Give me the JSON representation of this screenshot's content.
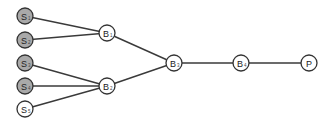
{
  "diagram": {
    "type": "tree",
    "colors": {
      "filled": "#a9a9a9",
      "empty": "#ffffff",
      "stroke": "#333333",
      "edge": "#3a3a3a"
    },
    "nodes": [
      {
        "id": "S1",
        "label": "S",
        "sub": "1",
        "x": 25,
        "y": 16,
        "filled": true
      },
      {
        "id": "S2",
        "label": "S",
        "sub": "2",
        "x": 25,
        "y": 40,
        "filled": true
      },
      {
        "id": "S3",
        "label": "S",
        "sub": "3",
        "x": 25,
        "y": 63,
        "filled": true
      },
      {
        "id": "S4",
        "label": "S",
        "sub": "4",
        "x": 25,
        "y": 86,
        "filled": true
      },
      {
        "id": "S5",
        "label": "S",
        "sub": "5",
        "x": 25,
        "y": 109,
        "filled": false
      },
      {
        "id": "B1",
        "label": "B",
        "sub": "1",
        "x": 107,
        "y": 33,
        "filled": false
      },
      {
        "id": "B2",
        "label": "B",
        "sub": "2",
        "x": 107,
        "y": 86,
        "filled": false
      },
      {
        "id": "B3",
        "label": "B",
        "sub": "3",
        "x": 174,
        "y": 63,
        "filled": false
      },
      {
        "id": "B4",
        "label": "B",
        "sub": "4",
        "x": 241,
        "y": 63,
        "filled": false
      },
      {
        "id": "P",
        "label": "P",
        "sub": "",
        "x": 309,
        "y": 63,
        "filled": false
      }
    ],
    "edges": [
      [
        "S1",
        "B1"
      ],
      [
        "S2",
        "B1"
      ],
      [
        "S3",
        "B2"
      ],
      [
        "S4",
        "B2"
      ],
      [
        "S5",
        "B2"
      ],
      [
        "B1",
        "B3"
      ],
      [
        "B2",
        "B3"
      ],
      [
        "B3",
        "B4"
      ],
      [
        "B4",
        "P"
      ]
    ]
  }
}
